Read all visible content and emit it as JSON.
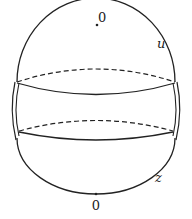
{
  "diagram": {
    "labels": {
      "top_point": "0",
      "bottom_point": "0",
      "upper_right": "u",
      "lower_right": "z"
    },
    "colors": {
      "stroke": "#222222",
      "background": "#ffffff"
    }
  }
}
